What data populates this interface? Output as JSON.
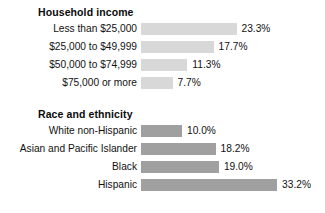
{
  "chart_data": {
    "type": "bar",
    "title": "",
    "xlabel": "",
    "ylabel": "",
    "orientation": "horizontal",
    "grid": false,
    "legend": false,
    "xlim": [
      0,
      35
    ],
    "groups": [
      {
        "title": "Household income",
        "bar_color": "#d8d8d8",
        "categories": [
          "Less than $25,000",
          "$25,000 to $49,999",
          "$50,000 to $74,999",
          "$75,000 or more"
        ],
        "values": [
          23.3,
          17.7,
          11.3,
          7.7
        ],
        "value_labels": [
          "23.3%",
          "17.7%",
          "11.3%",
          "7.7%"
        ]
      },
      {
        "title": "Race and ethnicity",
        "bar_color": "#a0a0a0",
        "categories": [
          "White non-Hispanic",
          "Asian and Pacific Islander",
          "Black",
          "Hispanic"
        ],
        "values": [
          10.0,
          18.2,
          19.0,
          33.2
        ],
        "value_labels": [
          "10.0%",
          "18.2%",
          "19.0%",
          "33.2%"
        ]
      }
    ]
  }
}
